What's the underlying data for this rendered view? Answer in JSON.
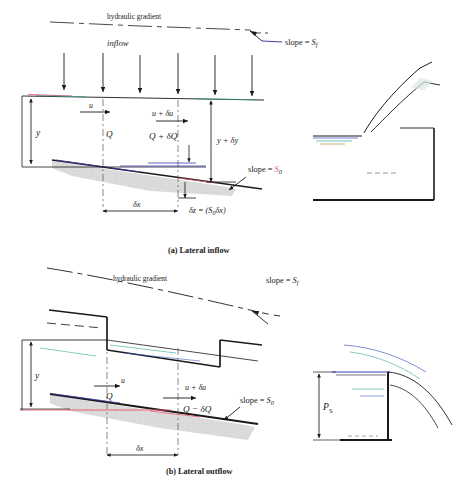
{
  "figure": {
    "title": "",
    "panels": [
      {
        "id": "a",
        "caption": "(a)  Lateral inflow",
        "labels": {
          "hydraulic_gradient": "hydraulic gradient",
          "slope_sf": "slope = ",
          "slope_sf_sym": "S",
          "slope_sf_sub": "f",
          "inflow": "inflow",
          "depth_y": "y",
          "velocity_u": "u",
          "discharge_q": "Q",
          "velocity_u_du": "u + δu",
          "discharge_q_dq": "Q + δQ",
          "depth_y_dy": "y + δy",
          "slope_s0": "slope = ",
          "slope_s0_sym": "S",
          "slope_s0_sub": "0",
          "delta_x": "δx",
          "delta_z": "δz = (S",
          "delta_z_sub": "0",
          "delta_z_tail": "δx)"
        },
        "inflow_arrow_count": 6
      },
      {
        "id": "b",
        "caption": "(b)  Lateral outflow",
        "labels": {
          "hydraulic_gradient": "hydraulic gradient",
          "slope_sf": "slope = ",
          "slope_sf_sym": "S",
          "slope_sf_sub": "f",
          "depth_y": "y",
          "velocity_u": "u",
          "discharge_q": "Q",
          "velocity_u_du": "u + δu",
          "discharge_q_dq": "Q − δQ",
          "slope_s0": "slope = ",
          "slope_s0_sym": "S",
          "slope_s0_sub": "0",
          "delta_x": "δx",
          "weir_height": "P",
          "weir_height_sub": "S"
        }
      }
    ],
    "colors": {
      "ink": "#1a1a1a",
      "blue_line": "#3d3db5",
      "red_line": "#e8546a",
      "teal_line": "#2f9c8f",
      "ground_fill": "#d9d9d9",
      "water_blue": "#4a5fc1",
      "water_teal": "#36a79b",
      "background": "#ffffff"
    }
  }
}
